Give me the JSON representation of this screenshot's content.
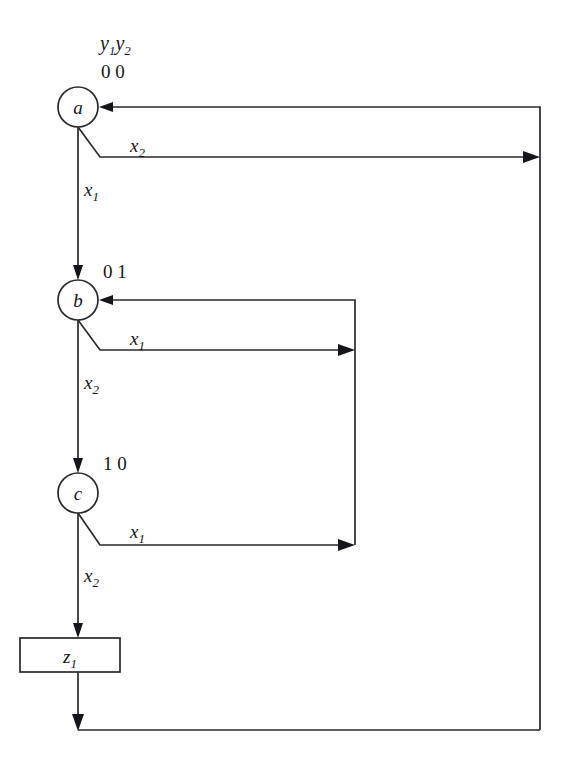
{
  "diagram": {
    "type": "state-flow-diagram",
    "canvas": {
      "width": 565,
      "height": 771
    },
    "ink_color": "#2a2a2e",
    "background_color": "#ffffff",
    "header": {
      "state_vars_label": "y",
      "state_var_1_sub": "1",
      "state_var_2_letter": "y",
      "state_var_2_sub": "2"
    },
    "states": [
      {
        "id": "a",
        "label": "a",
        "code": "0 0",
        "code_is_header": true,
        "cx": 78,
        "cy": 107,
        "r": 20
      },
      {
        "id": "b",
        "label": "b",
        "code": "0 1",
        "code_is_header": false,
        "cx": 78,
        "cy": 300,
        "r": 20
      },
      {
        "id": "c",
        "label": "c",
        "code": "1 0",
        "code_is_header": false,
        "cx": 78,
        "cy": 493,
        "r": 20
      }
    ],
    "output_box": {
      "id": "z1",
      "label": "z",
      "sub": "1",
      "x": 20,
      "y": 638,
      "width": 100,
      "height": 34
    },
    "edge_labels": [
      {
        "id": "a-x2",
        "base": "x",
        "sub": "2",
        "x": 130,
        "y": 152
      },
      {
        "id": "a-x1",
        "base": "x",
        "sub": "1",
        "x": 84,
        "y": 196
      },
      {
        "id": "b-x1",
        "base": "x",
        "sub": "1",
        "x": 130,
        "y": 345
      },
      {
        "id": "b-x2",
        "base": "x",
        "sub": "2",
        "x": 84,
        "y": 389
      },
      {
        "id": "c-x1",
        "base": "x",
        "sub": "1",
        "x": 130,
        "y": 538
      },
      {
        "id": "c-x2",
        "base": "x",
        "sub": "2",
        "x": 84,
        "y": 582
      }
    ],
    "transitions": [
      {
        "from": "a",
        "to": "b",
        "condition": "x1",
        "kind": "down"
      },
      {
        "from": "a",
        "to": "a",
        "condition": "x2",
        "kind": "loop-outer"
      },
      {
        "from": "b",
        "to": "c",
        "condition": "x2",
        "kind": "down"
      },
      {
        "from": "b",
        "to": "b",
        "condition": "x1",
        "kind": "loop-inner"
      },
      {
        "from": "c",
        "to": "z1",
        "condition": "x2",
        "kind": "down"
      },
      {
        "from": "c",
        "to": "b",
        "condition": "x1",
        "kind": "loop-inner"
      },
      {
        "from": "z1",
        "to": "a",
        "condition": "",
        "kind": "return-outer"
      }
    ],
    "return_paths": {
      "inner_x": 355,
      "inner_top_y": 300,
      "inner_bottom_y": 545,
      "outer_x": 540,
      "outer_top_y": 107,
      "outer_bottom_y": 730
    }
  }
}
